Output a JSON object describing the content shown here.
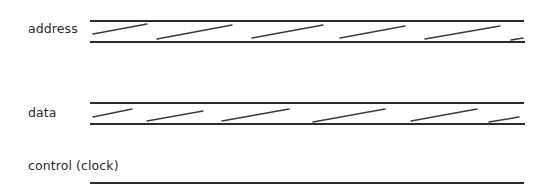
{
  "diagram": {
    "signals": [
      {
        "label": "address",
        "type": "bus",
        "label_pos": {
          "x": 28,
          "y": 23
        },
        "rails": {
          "x1": 90,
          "x2": 524,
          "top_y": 21,
          "bottom_y": 42
        },
        "hatches": [
          [
            93,
            34,
            147,
            24
          ],
          [
            157,
            39,
            232,
            25
          ],
          [
            252,
            38,
            323,
            25
          ],
          [
            340,
            38,
            405,
            26
          ],
          [
            425,
            39,
            500,
            26
          ],
          [
            511,
            40,
            523,
            38
          ]
        ]
      },
      {
        "label": "data",
        "type": "bus",
        "label_pos": {
          "x": 28,
          "y": 107
        },
        "rails": {
          "x1": 90,
          "x2": 524,
          "top_y": 103,
          "bottom_y": 124
        },
        "hatches": [
          [
            93,
            117,
            132,
            109
          ],
          [
            147,
            121,
            203,
            111
          ],
          [
            222,
            121,
            289,
            109
          ],
          [
            313,
            122,
            385,
            109
          ],
          [
            411,
            121,
            477,
            109
          ],
          [
            489,
            122,
            519,
            117
          ]
        ]
      },
      {
        "label": "control (clock)",
        "type": "line",
        "label_pos": {
          "x": 28,
          "y": 160
        },
        "rails": {
          "x1": 90,
          "x2": 524,
          "y": 183
        }
      }
    ],
    "colors": {
      "line": "#2b2b2b",
      "text": "#2a2a2a",
      "background": "#ffffff"
    }
  }
}
